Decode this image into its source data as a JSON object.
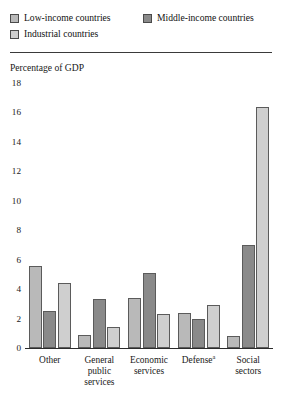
{
  "legend": {
    "items": [
      {
        "label": "Low-income countries",
        "color": "#b9b9b9"
      },
      {
        "label": "Middle-income countries",
        "color": "#8a8a8a"
      },
      {
        "label": "Industrial countries",
        "color": "#cfcfcf"
      }
    ]
  },
  "axis_title": "Percentage of GDP",
  "yticks": [
    "18",
    "16",
    "14",
    "12",
    "10",
    "8",
    "6",
    "4",
    "2",
    "0"
  ],
  "chart_data": {
    "type": "bar",
    "title": "",
    "subtitle": "",
    "xlabel": "",
    "ylabel": "Percentage of GDP",
    "ylim": [
      0,
      18
    ],
    "ytick_step": 2,
    "grid": false,
    "legend_position": "top-left",
    "categories": [
      "Other",
      "General public services",
      "Economic services",
      "Defense",
      "Social sectors"
    ],
    "category_labels": [
      [
        "Other"
      ],
      [
        "General",
        "public",
        "services"
      ],
      [
        "Economic",
        "services"
      ],
      [
        "Defense"
      ],
      [
        "Social",
        "sectors"
      ]
    ],
    "category_footnote_marks": [
      "",
      "",
      "",
      "a",
      ""
    ],
    "series": [
      {
        "name": "Low-income countries",
        "color": "#b9b9b9",
        "values": [
          5.6,
          0.9,
          3.4,
          2.4,
          0.8
        ]
      },
      {
        "name": "Middle-income countries",
        "color": "#8a8a8a",
        "values": [
          2.5,
          3.3,
          5.1,
          2.0,
          7.0
        ]
      },
      {
        "name": "Industrial countries",
        "color": "#cfcfcf",
        "values": [
          4.4,
          1.4,
          2.3,
          2.9,
          16.4
        ]
      }
    ]
  }
}
